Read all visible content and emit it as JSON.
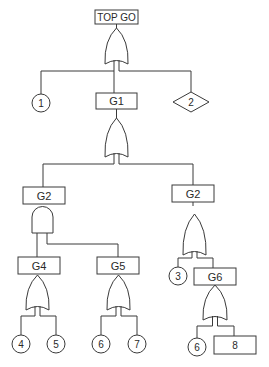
{
  "diagram": {
    "type": "fault-tree",
    "top_event": {
      "label": "TOP GO"
    },
    "gates": {
      "top": {
        "type": "OR"
      },
      "g1": {
        "label": "G1",
        "type": "OR"
      },
      "g2_left": {
        "label": "G2",
        "type": "AND"
      },
      "g2_right": {
        "label": "G2",
        "type": "OR"
      },
      "g4": {
        "label": "G4",
        "type": "OR"
      },
      "g5": {
        "label": "G5",
        "type": "OR"
      },
      "g6": {
        "label": "G6",
        "type": "OR"
      }
    },
    "basic_events": {
      "e1": {
        "label": "1",
        "shape": "circle"
      },
      "e3": {
        "label": "3",
        "shape": "circle"
      },
      "e4": {
        "label": "4",
        "shape": "circle"
      },
      "e5": {
        "label": "5",
        "shape": "circle"
      },
      "e6a": {
        "label": "6",
        "shape": "circle"
      },
      "e7": {
        "label": "7",
        "shape": "circle"
      },
      "e6b": {
        "label": "6",
        "shape": "circle"
      }
    },
    "undeveloped_events": {
      "e2": {
        "label": "2",
        "shape": "diamond"
      }
    },
    "intermediate_events": {
      "e8": {
        "label": "8",
        "shape": "rectangle"
      }
    }
  }
}
